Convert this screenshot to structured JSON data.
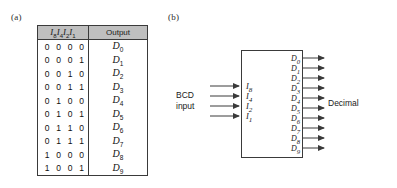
{
  "figure": {
    "panel_a_label": "(a)",
    "panel_b_label": "(b)"
  },
  "table": {
    "headers": {
      "inputs": "I8 I4 I2 I1",
      "output": "Output"
    },
    "input_bits": [
      {
        "name": "I",
        "sub": "8"
      },
      {
        "name": "I",
        "sub": "4"
      },
      {
        "name": "I",
        "sub": "2"
      },
      {
        "name": "I",
        "sub": "1"
      }
    ],
    "rows": [
      {
        "input": "0 0 0 0",
        "output": "D",
        "output_sub": "0"
      },
      {
        "input": "0 0 0 1",
        "output": "D",
        "output_sub": "1"
      },
      {
        "input": "0 0 1 0",
        "output": "D",
        "output_sub": "2"
      },
      {
        "input": "0 0 1 1",
        "output": "D",
        "output_sub": "3"
      },
      {
        "input": "0 1 0 0",
        "output": "D",
        "output_sub": "4"
      },
      {
        "input": "0 1 0 1",
        "output": "D",
        "output_sub": "5"
      },
      {
        "input": "0 1 1 0",
        "output": "D",
        "output_sub": "6"
      },
      {
        "input": "0 1 1 1",
        "output": "D",
        "output_sub": "7"
      },
      {
        "input": "1 0 0 0",
        "output": "D",
        "output_sub": "8"
      },
      {
        "input": "1 0 0 1",
        "output": "D",
        "output_sub": "9"
      }
    ]
  },
  "diagram": {
    "input_caption": "BCD\ninput",
    "output_caption": "Decimal",
    "inputs": [
      {
        "name": "I",
        "sub": "8"
      },
      {
        "name": "I",
        "sub": "4"
      },
      {
        "name": "I",
        "sub": "2"
      },
      {
        "name": "I",
        "sub": "1"
      }
    ],
    "outputs": [
      {
        "name": "D",
        "sub": "0"
      },
      {
        "name": "D",
        "sub": "1"
      },
      {
        "name": "D",
        "sub": "2"
      },
      {
        "name": "D",
        "sub": "3"
      },
      {
        "name": "D",
        "sub": "4"
      },
      {
        "name": "D",
        "sub": "5"
      },
      {
        "name": "D",
        "sub": "6"
      },
      {
        "name": "D",
        "sub": "7"
      },
      {
        "name": "D",
        "sub": "8"
      },
      {
        "name": "D",
        "sub": "9"
      }
    ]
  },
  "colors": {
    "line": "#3a3a3a",
    "header_fill": "#bfbfbf",
    "text": "#1a1a1a",
    "background": "#ffffff"
  }
}
